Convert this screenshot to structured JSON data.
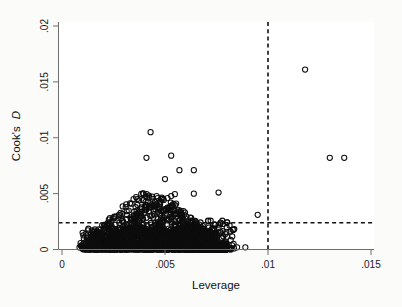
{
  "chart_data": {
    "type": "scatter",
    "title": "",
    "xlabel": "Leverage",
    "ylabel": "Cook's D",
    "ylabel_plain": "Cook's",
    "ylabel_italic": "D",
    "xlim": [
      0,
      0.015
    ],
    "ylim": [
      0,
      0.02
    ],
    "xticks": [
      0,
      0.005,
      0.01,
      0.015
    ],
    "xtick_labels": [
      "0",
      ".005",
      ".01",
      ".015"
    ],
    "yticks": [
      0,
      0.005,
      0.01,
      0.015,
      0.02
    ],
    "ytick_labels": [
      "0",
      ".005",
      ".01",
      ".015",
      ".02"
    ],
    "grid": false,
    "legend": null,
    "reference_lines": [
      {
        "name": "leverage-threshold",
        "orientation": "vertical",
        "value": 0.01,
        "style": "dashed"
      },
      {
        "name": "cooks-d-threshold",
        "orientation": "horizontal",
        "value": 0.0024,
        "style": "dashed"
      }
    ],
    "marker": {
      "shape": "open-circle",
      "radius": 2.6,
      "color": "#0d0d0d",
      "fill": "none"
    },
    "notable_points": [
      {
        "x": 0.0118,
        "y": 0.0161,
        "label": "high-leverage-high-cooksd-outlier"
      },
      {
        "x": 0.013,
        "y": 0.0082,
        "label": "high-leverage-outlier-1"
      },
      {
        "x": 0.0137,
        "y": 0.0082,
        "label": "high-leverage-outlier-2"
      },
      {
        "x": 0.0043,
        "y": 0.0105,
        "label": "max-cooksd-mid-leverage"
      },
      {
        "x": 0.0041,
        "y": 0.0082
      },
      {
        "x": 0.0053,
        "y": 0.0084
      },
      {
        "x": 0.005,
        "y": 0.0063
      },
      {
        "x": 0.0057,
        "y": 0.0071
      },
      {
        "x": 0.0064,
        "y": 0.0071
      },
      {
        "x": 0.0064,
        "y": 0.005
      },
      {
        "x": 0.0076,
        "y": 0.0051
      },
      {
        "x": 0.0095,
        "y": 0.0031
      },
      {
        "x": 0.0085,
        "y": 0.0002
      },
      {
        "x": 0.0089,
        "y": 0.0002
      }
    ],
    "cluster_description": "Dense mass of open circles spanning leverage 0.0008 to 0.0080 with Cook's D mostly 0 to 0.0025, thinning upward to about 0.005",
    "points": [
      [
        0.00085,
        0.00018
      ],
      [
        0.00092,
        0.00035
      ],
      [
        0.00098,
        0.00011
      ],
      [
        0.00104,
        0.00052
      ],
      [
        0.0011,
        0.00023
      ],
      [
        0.00116,
        0.00069
      ],
      [
        0.00122,
        0.00014
      ],
      [
        0.00128,
        0.00088
      ],
      [
        0.00134,
        0.00041
      ],
      [
        0.0014,
        0.00102
      ],
      [
        0.00146,
        0.00027
      ],
      [
        0.00152,
        0.00119
      ],
      [
        0.00158,
        0.00063
      ],
      [
        0.00164,
        9e-05
      ],
      [
        0.0017,
        0.00135
      ],
      [
        0.00176,
        0.0008
      ],
      [
        0.00182,
        0.00031
      ],
      [
        0.00188,
        0.00151
      ],
      [
        0.00194,
        0.00097
      ],
      [
        0.002,
        0.00044
      ],
      [
        0.00206,
        0.00166
      ],
      [
        0.00212,
        0.00113
      ],
      [
        0.00218,
        0.00058
      ],
      [
        0.00224,
        0.00188
      ],
      [
        0.0023,
        0.00128
      ],
      [
        0.00236,
        0.00072
      ],
      [
        0.00242,
        0.00205
      ],
      [
        0.00248,
        0.00143
      ],
      [
        0.00254,
        0.00086
      ],
      [
        0.0026,
        0.00221
      ],
      [
        0.00266,
        0.00158
      ],
      [
        0.00272,
        0.00099
      ],
      [
        0.00278,
        0.00238
      ],
      [
        0.00284,
        0.00174
      ],
      [
        0.0029,
        0.00113
      ],
      [
        0.00296,
        0.00254
      ],
      [
        0.00302,
        0.0019
      ],
      [
        0.00308,
        0.00126
      ],
      [
        0.00314,
        0.00271
      ],
      [
        0.0032,
        0.00205
      ],
      [
        0.00326,
        0.0014
      ],
      [
        0.00332,
        0.00288
      ],
      [
        0.00338,
        0.00221
      ],
      [
        0.00344,
        0.00153
      ],
      [
        0.0035,
        0.00305
      ],
      [
        0.00356,
        0.00237
      ],
      [
        0.00362,
        0.00167
      ],
      [
        0.00368,
        0.00322
      ],
      [
        0.00374,
        0.00253
      ],
      [
        0.0038,
        0.00181
      ],
      [
        0.00386,
        0.0034
      ],
      [
        0.00392,
        0.00268
      ],
      [
        0.00398,
        0.00195
      ],
      [
        0.00404,
        0.00357
      ],
      [
        0.0041,
        0.00284
      ],
      [
        0.00416,
        0.00208
      ],
      [
        0.00422,
        0.00374
      ],
      [
        0.00428,
        0.003
      ],
      [
        0.00434,
        0.00222
      ],
      [
        0.0044,
        0.00391
      ],
      [
        0.00446,
        0.00316
      ],
      [
        0.00452,
        0.00236
      ],
      [
        0.00458,
        0.00409
      ],
      [
        0.00464,
        0.00331
      ],
      [
        0.0047,
        0.00249
      ],
      [
        0.00476,
        0.00426
      ],
      [
        0.00482,
        0.00347
      ],
      [
        0.00488,
        0.00263
      ],
      [
        0.00494,
        0.00443
      ],
      [
        0.005,
        0.00362
      ],
      [
        0.00506,
        0.00277
      ],
      [
        0.00512,
        0.0046
      ],
      [
        0.00518,
        0.00378
      ],
      [
        0.00524,
        0.0029
      ],
      [
        0.0053,
        0.00478
      ],
      [
        0.00536,
        0.00394
      ],
      [
        0.00542,
        0.00304
      ],
      [
        0.00548,
        0.00495
      ],
      [
        0.00554,
        0.0041
      ],
      [
        0.0056,
        0.00318
      ],
      [
        0.00566,
        0.0034
      ],
      [
        0.00572,
        0.0026
      ],
      [
        0.00578,
        0.0019
      ],
      [
        0.00584,
        0.0012
      ],
      [
        0.0059,
        0.0006
      ],
      [
        0.006,
        0.0015
      ],
      [
        0.0061,
        0.001
      ],
      [
        0.0062,
        0.002
      ],
      [
        0.0063,
        0.0008
      ],
      [
        0.0064,
        0.0013
      ],
      [
        0.0065,
        0.00175
      ],
      [
        0.0066,
        0.00095
      ],
      [
        0.0067,
        0.0014
      ],
      [
        0.0068,
        0.0019
      ],
      [
        0.0069,
        0.0011
      ],
      [
        0.007,
        0.0016
      ],
      [
        0.0071,
        0.0021
      ],
      [
        0.0072,
        0.00125
      ],
      [
        0.0073,
        0.0018
      ],
      [
        0.0074,
        0.00225
      ],
      [
        0.0075,
        0.00145
      ],
      [
        0.0076,
        0.00195
      ],
      [
        0.0077,
        0.0024
      ],
      [
        0.0078,
        0.00165
      ],
      [
        0.008,
        0.00195
      ]
    ],
    "n_points_approx": 1400
  },
  "figure": {
    "background_color": "#fbfbfa",
    "plot_background_color": "#ffffff",
    "axis_color": "#6f6f6f",
    "marker_color": "#0d0d0d",
    "reference_line_color": "#111111"
  }
}
